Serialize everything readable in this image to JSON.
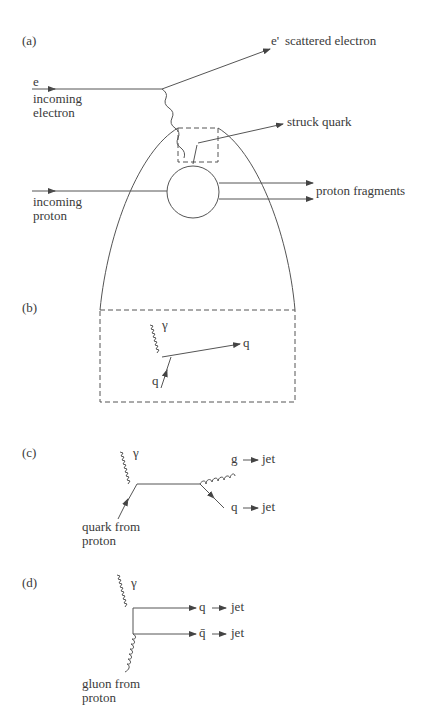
{
  "panels": {
    "a": {
      "label": "(a)",
      "incoming_electron_symbol": "e",
      "incoming_electron_line1": "incoming",
      "incoming_electron_line2": "electron",
      "scattered_symbol": "e'",
      "scattered_text": "scattered electron",
      "struck_quark": "struck quark",
      "incoming_proton_line1": "incoming",
      "incoming_proton_line2": "proton",
      "proton_fragments": "proton fragments"
    },
    "b": {
      "label": "(b)",
      "photon": "γ",
      "quark_out": "q",
      "quark_in": "q"
    },
    "c": {
      "label": "(c)",
      "photon": "γ",
      "gluon_out": "g",
      "quark_out": "q",
      "jet1": "jet",
      "jet2": "jet",
      "quark_src_line1": "quark from",
      "quark_src_line2": "proton"
    },
    "d": {
      "label": "(d)",
      "photon": "γ",
      "quark_out": "q",
      "antiquark_out": "q̄",
      "jet1": "jet",
      "jet2": "jet",
      "gluon_src_line1": "gluon from",
      "gluon_src_line2": "proton"
    }
  },
  "colors": {
    "line": "#444444",
    "text": "#3a3a3a"
  }
}
